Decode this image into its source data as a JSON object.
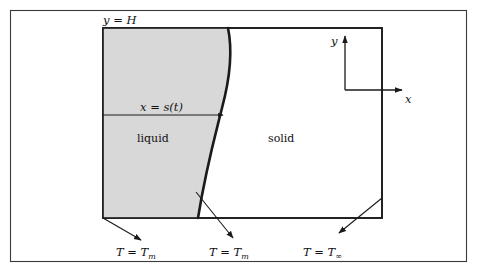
{
  "figure": {
    "colors": {
      "liquid_fill": "#d8d8d8",
      "solid_fill": "#ffffff",
      "line": "#1a1a1a",
      "frame": "#3a3a3a",
      "background": "#ffffff"
    },
    "labels": {
      "top_boundary": "y = H",
      "interface_position": "x = s(t)",
      "liquid_region": "liquid",
      "solid_region": "solid",
      "axis_y": "y",
      "axis_x": "x",
      "bc_left_prefix": "T = T",
      "bc_left_sub": "m",
      "bc_interface_prefix": "T = T",
      "bc_interface_sub": "m",
      "bc_right_prefix": "T = T",
      "bc_right_sub": "∞"
    },
    "geometry": {
      "outer_frame": {
        "x": 10,
        "y": 10,
        "width": 457,
        "height": 252
      },
      "domain_rect": {
        "x": 103,
        "y": 28,
        "width": 279,
        "height": 190
      },
      "interface_path": "M 228 28 C 233 52 230 78 222 108 C 214 140 206 168 198 218",
      "dim_arrow": {
        "x1": 103,
        "y1": 115,
        "x2": 224,
        "y2": 115
      },
      "axis_origin": {
        "x": 345,
        "y": 90
      },
      "axis_y_tip": {
        "x": 345,
        "y": 34
      },
      "axis_x_tip": {
        "x": 404,
        "y": 90
      }
    }
  }
}
